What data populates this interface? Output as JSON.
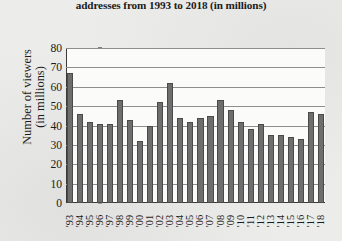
{
  "chart_data": {
    "type": "bar",
    "title": "addresses from 1993 to 2018 (in millions)",
    "xlabel": "",
    "ylabel_line1": "Number of viewers",
    "ylabel_line2": "(in millions)",
    "ylim": [
      0,
      80
    ],
    "yticks": [
      80,
      70,
      60,
      50,
      40,
      30,
      20,
      10,
      0
    ],
    "grid": true,
    "legend": "none",
    "bar_color": "#6e6e6e",
    "categories": [
      "'93",
      "'94",
      "'95",
      "'96",
      "'97",
      "'98",
      "'99",
      "'00",
      "'01",
      "'02",
      "'03",
      "'04",
      "'05",
      "'06",
      "'07",
      "'08",
      "'09",
      "'10",
      "'11",
      "'12",
      "'13",
      "'14",
      "'15",
      "'16",
      "'17",
      "'18"
    ],
    "values": [
      67,
      46,
      42,
      41,
      41,
      53,
      43,
      32,
      40,
      52,
      62,
      44,
      42,
      44,
      45,
      53,
      48,
      42,
      38,
      41,
      35,
      35,
      34,
      33,
      47,
      46
    ]
  }
}
